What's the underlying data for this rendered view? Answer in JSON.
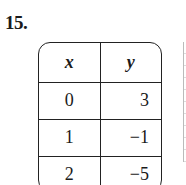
{
  "problem": {
    "number": "15."
  },
  "table": {
    "headers": [
      "x",
      "y"
    ],
    "rows": [
      {
        "x": "0",
        "y": "3"
      },
      {
        "x": "1",
        "y": "−1"
      },
      {
        "x": "2",
        "y": "−5"
      }
    ]
  }
}
